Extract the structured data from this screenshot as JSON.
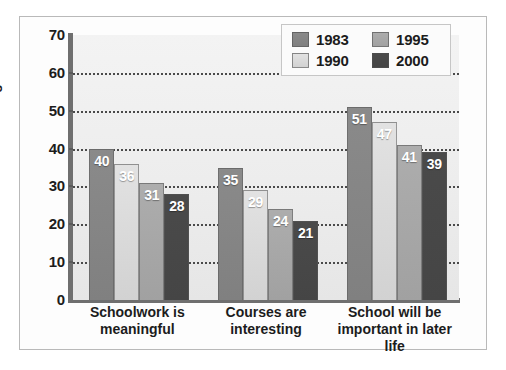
{
  "chart_data": {
    "type": "bar",
    "title": "",
    "subtitle": "",
    "xlabel": "",
    "ylabel": "Percentage",
    "ylim": [
      0,
      70
    ],
    "y_ticks": [
      0,
      10,
      20,
      30,
      40,
      50,
      60,
      70
    ],
    "y_tick_labels": [
      "0",
      "10",
      "20",
      "30",
      "40",
      "50",
      "60",
      "70"
    ],
    "grid": "horizontal-dotted",
    "legend_position": "top-right",
    "categories": [
      "Schoolwork is meaningful",
      "Courses are interesting",
      "School will be important in later life"
    ],
    "category_lines": [
      [
        "Schoolwork is",
        "meaningful"
      ],
      [
        "Courses are",
        "interesting"
      ],
      [
        "School will be",
        "important in later life"
      ]
    ],
    "series": [
      {
        "name": "1983",
        "color": "#8a8a8a",
        "values": [
          40,
          35,
          51
        ]
      },
      {
        "name": "1990",
        "color": "#e2e2e2",
        "values": [
          36,
          29,
          47
        ]
      },
      {
        "name": "1995",
        "color": "#adadad",
        "values": [
          31,
          24,
          41
        ]
      },
      {
        "name": "2000",
        "color": "#4a4a4a",
        "values": [
          28,
          21,
          39
        ]
      }
    ],
    "data_labels": [
      [
        "40",
        "36",
        "31",
        "28"
      ],
      [
        "35",
        "29",
        "24",
        "21"
      ],
      [
        "51",
        "47",
        "41",
        "39"
      ]
    ],
    "annotations": []
  },
  "legend": {
    "entries": [
      {
        "label": "1983",
        "swatch": "legend-swatch-1983"
      },
      {
        "label": "1995",
        "swatch": "legend-swatch-1995"
      },
      {
        "label": "1990",
        "swatch": "legend-swatch-1990"
      },
      {
        "label": "2000",
        "swatch": "legend-swatch-2000"
      }
    ]
  }
}
